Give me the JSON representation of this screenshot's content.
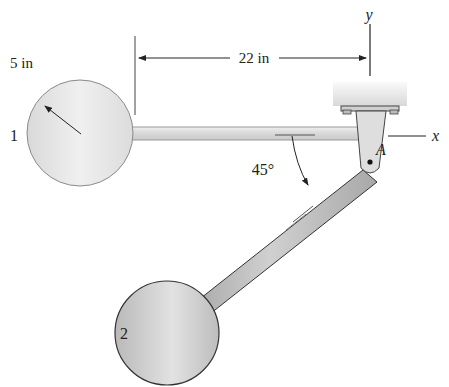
{
  "figure": {
    "cropped_top_text": "",
    "dimensions": {
      "horizontal_length": "22 in",
      "radius": "5 in"
    },
    "angle": "45°",
    "axes": {
      "x_label": "x",
      "y_label": "y"
    },
    "pin_label": "A",
    "disks": [
      {
        "id": "disk-1",
        "label": "1"
      },
      {
        "id": "disk-2",
        "label": "2"
      }
    ],
    "colors": {
      "disk1_fill": "#e6e6e6",
      "disk2_fill": "#c9c9c9",
      "rod_fill": "#d6d6d6",
      "outline": "#555555",
      "support_fill": "#e8e8e8"
    }
  }
}
